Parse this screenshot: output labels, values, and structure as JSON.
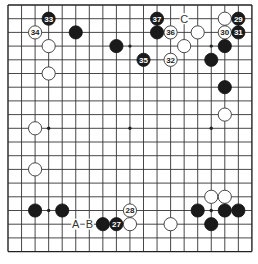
{
  "board": {
    "size": 19,
    "origin_x": 8,
    "origin_y": 5,
    "spacing_x": 13.55,
    "spacing_y": 13.7,
    "stone_radius": 6.6,
    "hoshi": [
      [
        3,
        3
      ],
      [
        9,
        3
      ],
      [
        15,
        3
      ],
      [
        3,
        9
      ],
      [
        9,
        9
      ],
      [
        15,
        9
      ],
      [
        3,
        15
      ],
      [
        9,
        15
      ],
      [
        15,
        15
      ]
    ],
    "colors": {
      "background": "#ffffff",
      "line": "#333333",
      "black_stone": "#1a1a1a",
      "white_stone": "#ffffff"
    }
  },
  "stones": [
    {
      "color": "black",
      "col": 3,
      "row": 1,
      "number": "33"
    },
    {
      "color": "white",
      "col": 2,
      "row": 2,
      "number": "34"
    },
    {
      "color": "white",
      "col": 3,
      "row": 3,
      "number": ""
    },
    {
      "color": "white",
      "col": 3,
      "row": 5,
      "number": ""
    },
    {
      "color": "black",
      "col": 5,
      "row": 2,
      "number": ""
    },
    {
      "color": "black",
      "col": 8,
      "row": 3,
      "number": ""
    },
    {
      "color": "white",
      "col": 2,
      "row": 9,
      "number": ""
    },
    {
      "color": "white",
      "col": 2,
      "row": 12,
      "number": ""
    },
    {
      "color": "black",
      "col": 11,
      "row": 1,
      "number": "37"
    },
    {
      "color": "white",
      "col": 16,
      "row": 1,
      "number": ""
    },
    {
      "color": "black",
      "col": 17,
      "row": 1,
      "number": "29"
    },
    {
      "color": "black",
      "col": 11,
      "row": 2,
      "number": ""
    },
    {
      "color": "white",
      "col": 12,
      "row": 2,
      "number": "36"
    },
    {
      "color": "white",
      "col": 14,
      "row": 2,
      "number": ""
    },
    {
      "color": "white",
      "col": 16,
      "row": 2,
      "number": "30"
    },
    {
      "color": "black",
      "col": 17,
      "row": 2,
      "number": "31"
    },
    {
      "color": "white",
      "col": 13,
      "row": 3,
      "number": ""
    },
    {
      "color": "black",
      "col": 16,
      "row": 3,
      "number": ""
    },
    {
      "color": "black",
      "col": 10,
      "row": 4,
      "number": "35"
    },
    {
      "color": "white",
      "col": 12,
      "row": 4,
      "number": "32"
    },
    {
      "color": "black",
      "col": 15,
      "row": 4,
      "number": ""
    },
    {
      "color": "black",
      "col": 16,
      "row": 6,
      "number": ""
    },
    {
      "color": "white",
      "col": 16,
      "row": 8,
      "number": ""
    },
    {
      "color": "black",
      "col": 2,
      "row": 15,
      "number": ""
    },
    {
      "color": "black",
      "col": 4,
      "row": 15,
      "number": ""
    },
    {
      "color": "black",
      "col": 7,
      "row": 16,
      "number": ""
    },
    {
      "color": "black",
      "col": 8,
      "row": 16,
      "number": "27"
    },
    {
      "color": "white",
      "col": 9,
      "row": 15,
      "number": "28"
    },
    {
      "color": "white",
      "col": 9,
      "row": 16,
      "number": ""
    },
    {
      "color": "white",
      "col": 12,
      "row": 16,
      "number": ""
    },
    {
      "color": "white",
      "col": 15,
      "row": 14,
      "number": ""
    },
    {
      "color": "white",
      "col": 16,
      "row": 14,
      "number": ""
    },
    {
      "color": "black",
      "col": 14,
      "row": 15,
      "number": ""
    },
    {
      "color": "black",
      "col": 16,
      "row": 15,
      "number": ""
    },
    {
      "color": "black",
      "col": 17,
      "row": 15,
      "number": ""
    },
    {
      "color": "black",
      "col": 15,
      "row": 16,
      "number": ""
    }
  ],
  "labels": [
    {
      "text": "C",
      "col": 13,
      "row": 1
    },
    {
      "text": "A",
      "col": 5,
      "row": 16
    },
    {
      "text": "B",
      "col": 6,
      "row": 16
    }
  ]
}
